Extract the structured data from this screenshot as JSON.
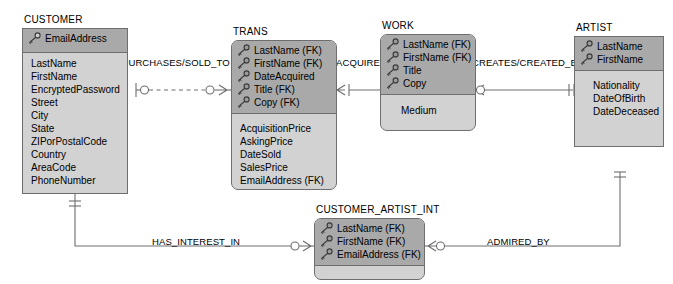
{
  "diagram": {
    "type": "crows-foot-ERD",
    "colors": {
      "key_section_fill": "#a9a9a9",
      "body_fill": "#d2d2d2",
      "border": "#6e6e6e",
      "line": "#6e6e6e",
      "text": "#000000",
      "background": "#ffffff"
    }
  },
  "entities": [
    {
      "id": "customer",
      "name": "CUSTOMER",
      "key_attributes": [
        "EmailAddress"
      ],
      "nonkey_attributes": [
        "LastName",
        "FirstName",
        "EncryptedPassword",
        "Street",
        "City",
        "State",
        "ZIPorPostalCode",
        "Country",
        "AreaCode",
        "PhoneNumber"
      ]
    },
    {
      "id": "trans",
      "name": "TRANS",
      "key_attributes": [
        "LastName (FK)",
        "FirstName (FK)",
        "DateAcquired",
        "Title (FK)",
        "Copy (FK)"
      ],
      "nonkey_attributes": [
        "AcquisitionPrice",
        "AskingPrice",
        "DateSold",
        "SalesPrice",
        "EmailAddress (FK)"
      ]
    },
    {
      "id": "work",
      "name": "WORK",
      "key_attributes": [
        "LastName (FK)",
        "FirstName (FK)",
        "Title",
        "Copy"
      ],
      "nonkey_attributes": [
        "Medium"
      ]
    },
    {
      "id": "artist",
      "name": "ARTIST",
      "key_attributes": [
        "LastName",
        "FirstName"
      ],
      "nonkey_attributes": [
        "Nationality",
        "DateOfBirth",
        "DateDeceased"
      ]
    },
    {
      "id": "customer_artist_int",
      "name": "CUSTOMER_ARTIST_INT",
      "key_attributes": [
        "LastName (FK)",
        "FirstName (FK)",
        "EmailAddress (FK)"
      ],
      "nonkey_attributes": []
    }
  ],
  "relationships": [
    {
      "id": "purchases_sold_to",
      "label": "PURCHASES/SOLD_TO",
      "from": "CUSTOMER",
      "to": "TRANS",
      "line_style": "dashed",
      "identifying": false,
      "from_cardinality": "one-optional",
      "to_cardinality": "many-optional"
    },
    {
      "id": "acquired",
      "label": "ACQUIRED",
      "from": "TRANS",
      "to": "WORK",
      "line_style": "solid",
      "identifying": true,
      "from_cardinality": "many-mandatory",
      "to_cardinality": "one-mandatory"
    },
    {
      "id": "creates_created_by",
      "label": "CREATES/CREATED_BY",
      "from": "WORK",
      "to": "ARTIST",
      "line_style": "solid",
      "identifying": true,
      "from_cardinality": "many-optional",
      "to_cardinality": "one-mandatory"
    },
    {
      "id": "has_interest_in",
      "label": "HAS_INTEREST_IN",
      "from": "CUSTOMER",
      "to": "CUSTOMER_ARTIST_INT",
      "line_style": "solid",
      "identifying": true,
      "from_cardinality": "one-mandatory",
      "to_cardinality": "many-optional"
    },
    {
      "id": "admired_by",
      "label": "ADMIRED_BY",
      "from": "CUSTOMER_ARTIST_INT",
      "to": "ARTIST",
      "line_style": "solid",
      "identifying": true,
      "from_cardinality": "many-optional",
      "to_cardinality": "one-mandatory"
    }
  ],
  "icons": {
    "key": "key-icon"
  }
}
